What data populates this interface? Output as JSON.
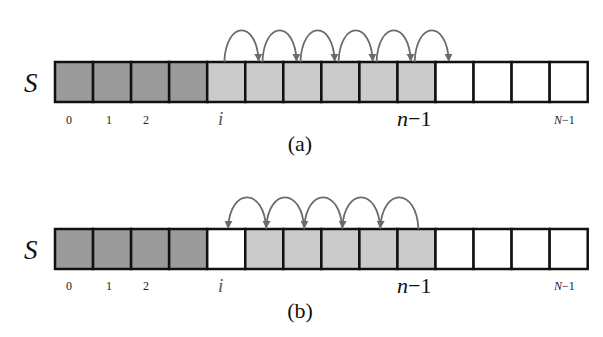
{
  "colors": {
    "used_dark": "#9b9b9b",
    "shifted_light": "#cbcbcb",
    "empty": "#ffffff",
    "border": "#111111",
    "arrow": "#6b6b6b"
  },
  "array": {
    "name": "S",
    "capacity": 14,
    "index_labels": {
      "zero": "0",
      "one": "1",
      "two": "2",
      "i": "i",
      "n_minus_1": "n−1",
      "N_minus_1": "N−1"
    }
  },
  "panels": [
    {
      "caption": "(a)",
      "cells": [
        "dark",
        "dark",
        "dark",
        "dark",
        "light",
        "light",
        "light",
        "light",
        "light",
        "light",
        "white",
        "white",
        "white",
        "white"
      ],
      "arrow_direction": "right",
      "description": "Shift elements right from index i to n-1 to make room for insertion"
    },
    {
      "caption": "(b)",
      "cells": [
        "dark",
        "dark",
        "dark",
        "dark",
        "white",
        "light",
        "light",
        "light",
        "light",
        "light",
        "white",
        "white",
        "white",
        "white"
      ],
      "arrow_direction": "left",
      "description": "Shift elements left to fill the gap at index i after removal"
    }
  ]
}
